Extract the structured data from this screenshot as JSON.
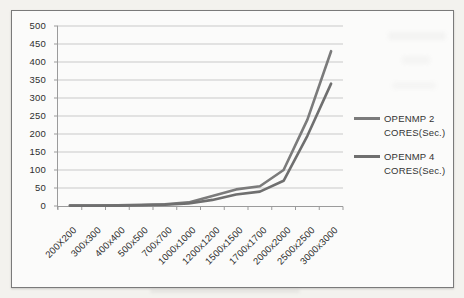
{
  "chart_data": {
    "type": "line",
    "title": "",
    "xlabel": "",
    "ylabel": "",
    "categories": [
      "200X200",
      "300x300",
      "400x400",
      "500x500",
      "700x700",
      "1000x1000",
      "1200x1200",
      "1500x1500",
      "1700x1700",
      "2000x2000",
      "2500x2500",
      "3000x3000"
    ],
    "series": [
      {
        "name": "OPENMP 2 CORES(Sec.)",
        "legend_lines": [
          "OPENMP 2",
          "CORES(Sec.)"
        ],
        "values": [
          1,
          1,
          2,
          3,
          5,
          10,
          28,
          46,
          55,
          100,
          240,
          430
        ],
        "color": "#7b7b7b"
      },
      {
        "name": "OPENMP 4 CORES(Sec.)",
        "legend_lines": [
          "OPENMP 4",
          "CORES(Sec.)"
        ],
        "values": [
          1,
          1,
          1,
          2,
          4,
          7,
          17,
          32,
          40,
          70,
          195,
          340
        ],
        "color": "#6f6f6f"
      }
    ],
    "ylim": [
      0,
      500
    ],
    "ytick_step": 50,
    "yticks": [
      "0",
      "50",
      "100",
      "150",
      "200",
      "250",
      "300",
      "350",
      "400",
      "450",
      "500"
    ],
    "grid": true,
    "legend_position": "right"
  },
  "colors": {
    "page_bg": "#f3f2ee",
    "chart_bg": "#fbfbfa",
    "border": "#7a7a7a",
    "gridline": "#c9c9c9",
    "axis": "#9b9b9b",
    "tick_text": "#2f2f2f"
  }
}
